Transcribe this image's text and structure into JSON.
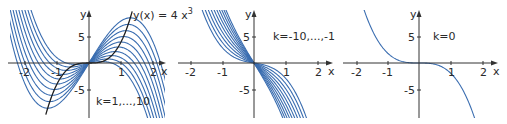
{
  "chart_data": [
    {
      "type": "line",
      "title": "",
      "function": "f_k(x) = -2x^3 + k*x",
      "coef_cubic": -2,
      "k_values": [
        1,
        2,
        3,
        4,
        5,
        6,
        7,
        8,
        9,
        10
      ],
      "annotation": "k=1,...,10",
      "envelope": {
        "label": "y(x) = 4 x",
        "label_exp": "3",
        "coef": 4,
        "power": 3,
        "description": "locus of extrema y(x)=4x^3",
        "x_range": [
          -1.35,
          1.35
        ]
      },
      "xlabel": "x",
      "ylabel": "y",
      "xticks": [
        -2,
        -1,
        1,
        2
      ],
      "yticks": [
        5,
        -5
      ],
      "xlim": [
        -2.5,
        2.5
      ],
      "ylim": [
        -10,
        10
      ],
      "grid": false
    },
    {
      "type": "line",
      "title": "",
      "function": "f_k(x) = -2x^3 + k*x",
      "coef_cubic": -2,
      "k_values": [
        -10,
        -9,
        -8,
        -7,
        -6,
        -5,
        -4,
        -3,
        -2,
        -1
      ],
      "annotation": "k=-10,...,-1",
      "xlabel": "x",
      "ylabel": "y",
      "xticks": [
        -2,
        -1,
        1,
        2
      ],
      "yticks": [
        5,
        -5
      ],
      "xlim": [
        -2.5,
        2.5
      ],
      "ylim": [
        -10,
        10
      ],
      "grid": false
    },
    {
      "type": "line",
      "title": "",
      "function": "f_k(x) = -2x^3 + k*x",
      "coef_cubic": -2,
      "k_values": [
        0
      ],
      "annotation": "k=0",
      "xlabel": "x",
      "ylabel": "y",
      "xticks": [
        -2,
        -1,
        1,
        2
      ],
      "yticks": [
        5,
        -5
      ],
      "xlim": [
        -2.5,
        2.5
      ],
      "ylim": [
        -10,
        10
      ],
      "grid": false
    }
  ],
  "panels": [
    {
      "origin_x": 89,
      "origin_y": 63,
      "px_per_x": 32,
      "px_per_y": 5.25,
      "clip_left": 10,
      "clip_right": 165,
      "note_x": 95,
      "note_y": 102
    },
    {
      "origin_x": 254,
      "origin_y": 63,
      "px_per_x": 32,
      "px_per_y": 5.25,
      "clip_left": 200,
      "clip_right": 310,
      "note_x": 272,
      "note_y": 40
    },
    {
      "origin_x": 419,
      "origin_y": 63,
      "px_per_x": 32,
      "px_per_y": 5.25,
      "clip_left": 360,
      "clip_right": 480,
      "note_x": 432,
      "note_y": 40
    }
  ],
  "colors": {
    "curve": "#3a6db0",
    "envelope": "#1e1e1e",
    "axis": "#333333",
    "text": "#2a2a2a"
  },
  "labels": {
    "p1": {
      "annotation": "k=1,...,10",
      "envelope": "y(x) = 4 x",
      "envelope_exp": "3"
    },
    "p2": {
      "annotation": "k=-10,...,-1"
    },
    "p3": {
      "annotation": "k=0"
    },
    "x": "x",
    "y": "y",
    "xtick_m2": "-2",
    "xtick_m1": "-1",
    "xtick_1": "1",
    "xtick_2": "2",
    "ytick_5": "5",
    "ytick_m5": "-5"
  }
}
